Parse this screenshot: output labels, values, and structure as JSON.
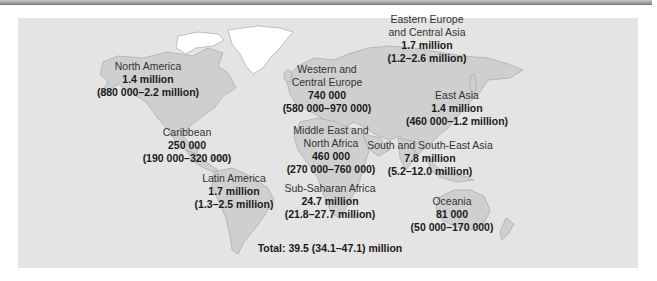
{
  "figure": {
    "title": "",
    "colors": {
      "ocean": "#e4e4e4",
      "land": "#cfcfcf",
      "ice": "#ffffff",
      "border": "#a8a8a8"
    },
    "regions": [
      {
        "id": "north-america",
        "name_lines": [
          "North America"
        ],
        "estimate": "1.4 million",
        "range": "(880 000–2.2 million)"
      },
      {
        "id": "caribbean",
        "name_lines": [
          "Caribbean"
        ],
        "estimate": "250 000",
        "range": "(190 000–320 000)"
      },
      {
        "id": "latin-america",
        "name_lines": [
          "Latin America"
        ],
        "estimate": "1.7 million",
        "range": "(1.3–2.5 million)"
      },
      {
        "id": "western-central-europe",
        "name_lines": [
          "Western and",
          "Central Europe"
        ],
        "estimate": "740 000",
        "range": "(580 000–970 000)"
      },
      {
        "id": "middle-east-north-africa",
        "name_lines": [
          "Middle East and",
          "North Africa"
        ],
        "estimate": "460 000",
        "range": "(270 000–760 000)"
      },
      {
        "id": "sub-saharan-africa",
        "name_lines": [
          "Sub-Saharan Africa"
        ],
        "estimate": "24.7 million",
        "range": "(21.8–27.7 million)"
      },
      {
        "id": "eastern-europe-central-asia",
        "name_lines": [
          "Eastern Europe",
          "and Central Asia"
        ],
        "estimate": "1.7 million",
        "range": "(1.2–2.6 million)"
      },
      {
        "id": "east-asia",
        "name_lines": [
          "East Asia"
        ],
        "estimate": "1.4 million",
        "range": "(460 000–1.2 million)"
      },
      {
        "id": "south-south-east-asia",
        "name_lines": [
          "South and South-East Asia"
        ],
        "estimate": "7.8 million",
        "range": "(5.2–12.0 million)"
      },
      {
        "id": "oceania",
        "name_lines": [
          "Oceania"
        ],
        "estimate": "81 000",
        "range": "(50 000–170 000)"
      }
    ],
    "total": "Total: 39.5 (34.1–47.1) million"
  }
}
